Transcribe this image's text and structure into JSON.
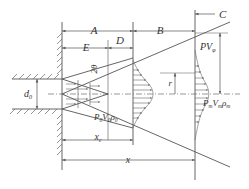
{
  "diagram": {
    "type": "free-jet-structure",
    "labels": {
      "A": "A",
      "B": "B",
      "C": "C",
      "D": "D",
      "E": "E",
      "two_theta": "2θ",
      "nozzle_diameter": "d₀",
      "core_length": "xc",
      "axial_distance": "x",
      "radius": "R",
      "r": "r",
      "exit_state": "P₀V₀ρ₀",
      "local_state": "PV",
      "axis_state": "PmVmρm"
    },
    "label_parts": {
      "exit_P": "P",
      "exit_P_sub": "0",
      "exit_V": "V",
      "exit_V_sub": "0",
      "exit_rho": "ρ",
      "exit_rho_sub": "0",
      "local_P": "P",
      "local_V": "V",
      "local_V_sub": "φ",
      "axis_P": "P",
      "axis_P_sub": "m",
      "axis_V": "V",
      "axis_V_sub": "m",
      "axis_rho": "ρ",
      "axis_rho_sub": "m",
      "d": "d",
      "d_sub": "0",
      "xc": "x",
      "xc_sub": "c",
      "two_theta": "2θ"
    },
    "colors": {
      "line": "#555555",
      "text": "#333333",
      "background": "#ffffff"
    }
  }
}
